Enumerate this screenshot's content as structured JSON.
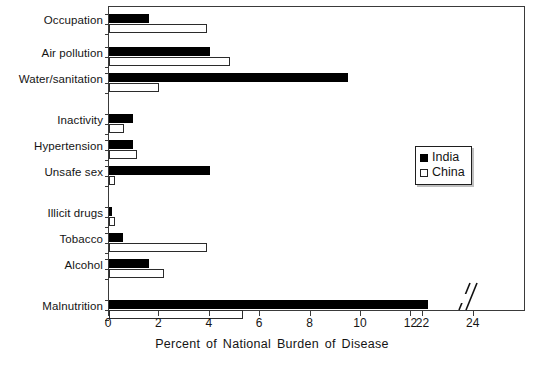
{
  "chart_data": {
    "type": "bar",
    "orientation": "horizontal",
    "title": "",
    "xlabel": "Percent of National Burden of Disease",
    "ylabel": "",
    "xlim": [
      0,
      25
    ],
    "xticks": [
      "0",
      "2",
      "4",
      "6",
      "8",
      "10",
      "12",
      "22",
      "24"
    ],
    "xtick_values": [
      0,
      2,
      4,
      6,
      8,
      10,
      12,
      22,
      24
    ],
    "axis_break": {
      "present": true,
      "between": [
        12,
        22
      ],
      "symbol": "//"
    },
    "grid": false,
    "legend_position": "center-right",
    "categories": [
      "Occupation",
      "Air pollution",
      "Water/sanitation",
      "Inactivity",
      "Hypertension",
      "Unsafe sex",
      "Illicit drugs",
      "Tobacco",
      "Alcohol",
      "Malnutrition"
    ],
    "series": [
      {
        "name": "India",
        "color": "#000000",
        "values": [
          1.6,
          4.0,
          9.5,
          0.95,
          0.95,
          4.0,
          0.12,
          0.55,
          1.6,
          22.2
        ]
      },
      {
        "name": "China",
        "color": "#ffffff",
        "values": [
          3.9,
          4.8,
          2.0,
          0.6,
          1.1,
          0.25,
          0.25,
          3.9,
          2.2,
          5.3
        ]
      }
    ]
  },
  "legend": {
    "items": [
      {
        "label": "India",
        "swatch": "filled-square"
      },
      {
        "label": "China",
        "swatch": "open-square"
      }
    ]
  }
}
